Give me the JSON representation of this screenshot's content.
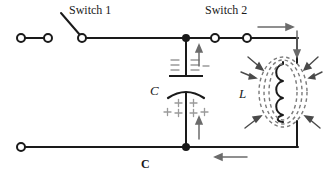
{
  "diagram": {
    "type": "electrical-schematic",
    "width": 323,
    "height": 180,
    "background_color": "#ffffff",
    "wire_color": "#1a1a1a",
    "field_color": "#6b6b6b",
    "charge_color": "#8a8a8a"
  },
  "labels": {
    "switch1": "Switch 1",
    "switch2": "Switch 2",
    "capacitor": "C",
    "inductor": "L",
    "ground": "C"
  },
  "components": {
    "terminals": [
      {
        "name": "left-terminal-outer",
        "cx": 21,
        "cy": 38,
        "r": 4
      },
      {
        "name": "left-terminal-inner",
        "cx": 48,
        "cy": 38,
        "r": 4
      },
      {
        "name": "switch1-pivot",
        "cx": 82,
        "cy": 38,
        "r": 4
      },
      {
        "name": "switch2-left-contact",
        "cx": 215,
        "cy": 38,
        "r": 4
      },
      {
        "name": "switch2-right-contact",
        "cx": 247,
        "cy": 38,
        "r": 4
      },
      {
        "name": "bottom-left-terminal",
        "cx": 21,
        "cy": 147,
        "r": 4
      }
    ],
    "junctions": [
      {
        "name": "top-node",
        "cx": 186,
        "cy": 38,
        "r": 3.6
      },
      {
        "name": "bottom-node",
        "cx": 186,
        "cy": 147,
        "r": 3.6
      }
    ],
    "switch1": {
      "state": "open",
      "blade_from": {
        "x": 82,
        "y": 38
      },
      "blade_to": {
        "x": 62,
        "y": 14
      }
    },
    "switch2": {
      "state": "closed",
      "contact_gap_from": {
        "x": 215,
        "y": 38
      },
      "contact_gap_to": {
        "x": 247,
        "y": 38
      }
    },
    "capacitor": {
      "plate_top_y": 76,
      "plate_bottom_y": 92,
      "plate_half_width": 17,
      "polarity_top": "negative",
      "polarity_bottom": "positive",
      "minus_count": 6,
      "plus_count": 6
    },
    "inductor": {
      "coil_turns": 4,
      "coil_top_y": 62,
      "coil_bottom_y": 122,
      "field_ellipses": 3,
      "field_arrows": 6
    }
  },
  "current_arrows": [
    {
      "name": "top-right-current-arrow",
      "direction": "right",
      "x1": 258,
      "y1": 27,
      "x2": 290,
      "y2": 27
    },
    {
      "name": "right-side-current-arrow",
      "direction": "down",
      "x1": 297,
      "y1": 31,
      "x2": 297,
      "y2": 56
    },
    {
      "name": "capacitor-top-current-arrow",
      "direction": "up",
      "x1": 199,
      "y1": 66,
      "x2": 199,
      "y2": 46
    },
    {
      "name": "capacitor-bottom-current-arrow",
      "direction": "up",
      "x1": 199,
      "y1": 139,
      "x2": 199,
      "y2": 117
    },
    {
      "name": "bottom-current-arrow",
      "direction": "left",
      "x1": 247,
      "y1": 157,
      "x2": 215,
      "y2": 157
    }
  ],
  "wires": [
    {
      "name": "wire-left-pair",
      "points": "25,38 44,38"
    },
    {
      "name": "wire-top-main",
      "points": "86,38 186,38"
    },
    {
      "name": "wire-top-node-to-switch2",
      "points": "186,38 211,38"
    },
    {
      "name": "wire-switch2-contacts",
      "points": "219,38 243,38"
    },
    {
      "name": "wire-switch2-to-right",
      "points": "251,38 297,38"
    },
    {
      "name": "wire-right-vertical-top",
      "points": "297,38 297,62"
    },
    {
      "name": "wire-right-vertical-bottom",
      "points": "297,122 297,147"
    },
    {
      "name": "wire-bottom-main",
      "points": "25,147 297,147"
    },
    {
      "name": "wire-capacitor-top",
      "points": "186,38 186,76"
    },
    {
      "name": "wire-capacitor-bottom",
      "points": "186,95 186,147"
    }
  ]
}
